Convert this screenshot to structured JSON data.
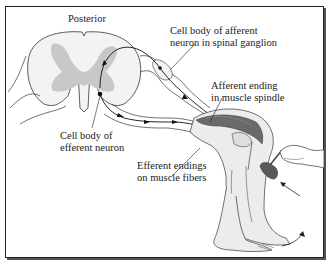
{
  "figure": {
    "labels": {
      "posterior": "Posterior",
      "afferent_cell_body_line1": "Cell body of afferent",
      "afferent_cell_body_line2": "neuron in spinal ganglion",
      "afferent_ending_line1": "Afferent ending",
      "afferent_ending_line2": "in muscle spindle",
      "efferent_cell_body_line1": "Cell body of",
      "efferent_cell_body_line2": "efferent neuron",
      "efferent_endings_line1": "Efferent endings",
      "efferent_endings_line2": "on muscle fibers"
    },
    "colors": {
      "line": "#222222",
      "gray_matter": "#c8c8c8",
      "white_matter": "#f3f3f3",
      "muscle_dark": "#6a6a6a",
      "skin": "#ececec",
      "hammer": "#5a5a5a"
    },
    "icons": [
      "spinal-cord-cross-section",
      "afferent-neuron-path",
      "efferent-neuron-path",
      "leg-illustration",
      "reflex-hammer",
      "hand",
      "strike-arrow",
      "kick-arrow"
    ]
  }
}
